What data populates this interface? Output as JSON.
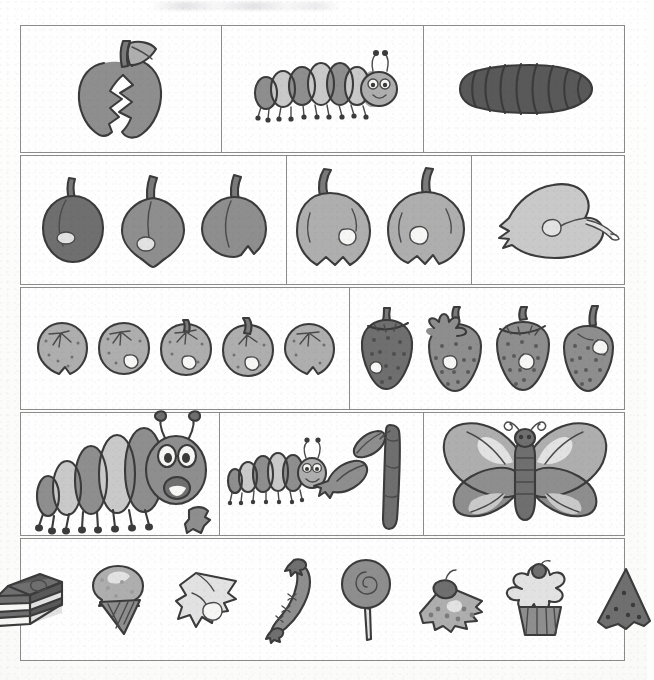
{
  "document": {
    "title": "The Very Hungry Caterpillar — story sequencing picture grid",
    "kind": "scanned worksheet",
    "page_background": "#fdfdfc",
    "ink_color": "#3b3b3b",
    "border_color": "#8b8b8b",
    "rows_count": 5,
    "panels_count": 13,
    "top_artifact": "faint scanner smudge"
  },
  "palette": {
    "dark": "#6f6f6f",
    "mid": "#8e8e8e",
    "light": "#aeaeae",
    "pale": "#c9c9c9",
    "very_pale": "#e2e2e2",
    "white": "#f6f6f5",
    "deep": "#595959",
    "outline": "#3b3b3b"
  },
  "rows": [
    {
      "index": 1,
      "name": "row-egg-and-caterpillar",
      "panels": [
        {
          "name": "panel-bitten-apple",
          "caption": "bitten apple with leaf",
          "item_count": 1,
          "items": [
            {
              "kind": "bitten-apple",
              "label": "bitten apple"
            }
          ]
        },
        {
          "name": "panel-caterpillar-small",
          "caption": "small striped caterpillar",
          "item_count": 1,
          "items": [
            {
              "kind": "caterpillar-small",
              "label": "caterpillar"
            }
          ]
        },
        {
          "name": "panel-cocoon",
          "caption": "dark cocoon / chrysalis",
          "item_count": 1,
          "items": [
            {
              "kind": "cocoon",
              "label": "cocoon"
            }
          ]
        }
      ]
    },
    {
      "index": 2,
      "name": "row-plums-apples-pear",
      "panels": [
        {
          "name": "panel-three-plums",
          "caption": "three plums with holes",
          "item_count": 3,
          "items": [
            {
              "kind": "plum",
              "label": "plum",
              "tone": "dark"
            },
            {
              "kind": "plum",
              "label": "plum",
              "tone": "mid"
            },
            {
              "kind": "plum",
              "label": "plum",
              "tone": "mid"
            }
          ]
        },
        {
          "name": "panel-two-apples",
          "caption": "two bitten apples",
          "item_count": 2,
          "items": [
            {
              "kind": "apple",
              "label": "apple"
            },
            {
              "kind": "apple",
              "label": "apple"
            }
          ]
        },
        {
          "name": "panel-pear",
          "caption": "one pear with hole",
          "item_count": 1,
          "items": [
            {
              "kind": "pear",
              "label": "pear"
            }
          ]
        }
      ]
    },
    {
      "index": 3,
      "name": "row-oranges-strawberries",
      "panels": [
        {
          "name": "panel-five-oranges",
          "caption": "five oranges with holes",
          "item_count": 5,
          "items": [
            {
              "kind": "orange",
              "label": "orange"
            },
            {
              "kind": "orange",
              "label": "orange"
            },
            {
              "kind": "orange",
              "label": "orange"
            },
            {
              "kind": "orange",
              "label": "orange"
            },
            {
              "kind": "orange",
              "label": "orange"
            }
          ]
        },
        {
          "name": "panel-four-strawberries",
          "caption": "four strawberries with holes",
          "item_count": 4,
          "items": [
            {
              "kind": "strawberry",
              "label": "strawberry"
            },
            {
              "kind": "strawberry",
              "label": "strawberry"
            },
            {
              "kind": "strawberry",
              "label": "strawberry"
            },
            {
              "kind": "strawberry",
              "label": "strawberry"
            }
          ]
        }
      ]
    },
    {
      "index": 4,
      "name": "row-big-caterpillar-leaf-butterfly",
      "panels": [
        {
          "name": "panel-big-caterpillar",
          "caption": "big fat caterpillar",
          "item_count": 1,
          "items": [
            {
              "kind": "caterpillar-big",
              "label": "big caterpillar"
            }
          ]
        },
        {
          "name": "panel-caterpillar-eating-leaf",
          "caption": "caterpillar eating a leaf on a stem",
          "item_count": 3,
          "items": [
            {
              "kind": "caterpillar-small",
              "label": "caterpillar"
            },
            {
              "kind": "leaf",
              "label": "nibbled leaf"
            },
            {
              "kind": "stem",
              "label": "stem with leaf"
            }
          ]
        },
        {
          "name": "panel-butterfly",
          "caption": "beautiful butterfly",
          "item_count": 1,
          "items": [
            {
              "kind": "butterfly",
              "label": "butterfly"
            }
          ]
        }
      ]
    },
    {
      "index": 5,
      "name": "row-saturday-feast",
      "panels": [
        {
          "name": "panel-saturday-foods",
          "caption": "Saturday feast of eight foods",
          "item_count": 8,
          "items": [
            {
              "kind": "cake",
              "label": "chocolate cake"
            },
            {
              "kind": "icecream",
              "label": "ice-cream cone"
            },
            {
              "kind": "cheese",
              "label": "slice of swiss cheese"
            },
            {
              "kind": "sausage",
              "label": "salami sausage"
            },
            {
              "kind": "lollipop",
              "label": "lollipop"
            },
            {
              "kind": "cherrypie",
              "label": "cherry pie slice"
            },
            {
              "kind": "cupcake",
              "label": "cupcake with cherry"
            },
            {
              "kind": "watermelon",
              "label": "watermelon slice"
            }
          ]
        }
      ]
    }
  ]
}
